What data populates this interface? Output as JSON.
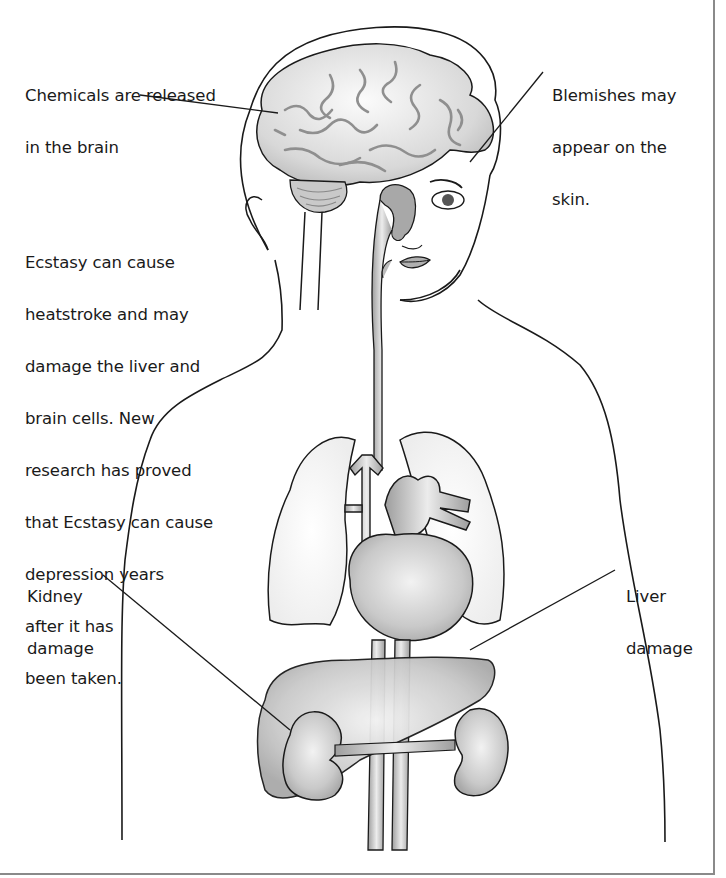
{
  "diagram": {
    "colors": {
      "outline": "#1a1a1a",
      "organ_fill": "#c8c8c8",
      "organ_light": "#e6e6e6",
      "vessel_fill": "#b4b4b4",
      "frame_border": "#8a8a8a",
      "background": "#ffffff"
    },
    "labels": {
      "chemicals": {
        "lines": [
          "Chemicals are released",
          "in the brain"
        ],
        "target": "brain"
      },
      "blemishes": {
        "lines": [
          "Blemishes may",
          "appear on the",
          "skin."
        ],
        "target": "skin"
      },
      "ecstasy_note": {
        "lines": [
          "Ecstasy can cause",
          "heatstroke and may",
          "damage the liver and",
          "brain cells. New",
          "research has proved",
          "that Ecstasy can cause",
          "depression years",
          "after it has",
          "been taken."
        ]
      },
      "kidney": {
        "lines": [
          "Kidney",
          "damage"
        ],
        "target": "kidney"
      },
      "liver": {
        "lines": [
          "Liver",
          "damage"
        ],
        "target": "liver"
      }
    },
    "organs": [
      "brain",
      "cerebellum",
      "esophagus",
      "trachea",
      "lungs",
      "heart",
      "aorta",
      "liver",
      "kidneys",
      "vena cava",
      "skin"
    ]
  }
}
